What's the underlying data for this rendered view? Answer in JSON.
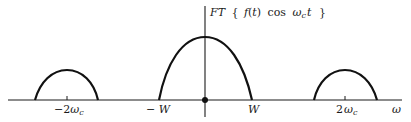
{
  "diagram": {
    "title": {
      "prefix": "FT",
      "open_brace": "{",
      "func": "f",
      "paren_open": "(",
      "var": "t",
      "paren_close": ")",
      "cos": "cos",
      "omega": "ω",
      "sub": "c",
      "t": "t",
      "close_brace": "}"
    },
    "x_axis_label": "ω",
    "ticks": [
      {
        "id": "neg-2wc",
        "coeff": "−2",
        "sym": "ω",
        "sub": "c"
      },
      {
        "id": "neg-w",
        "text": "− W"
      },
      {
        "id": "w",
        "text": "W"
      },
      {
        "id": "pos-2wc",
        "coeff": "2",
        "sym": "ω",
        "sub": "c"
      }
    ],
    "lobes": [
      {
        "name": "left-sideband",
        "center": "−2ωc",
        "relative_height": 0.48
      },
      {
        "name": "baseband",
        "center": "0",
        "half_width": "W",
        "relative_height": 1.0
      },
      {
        "name": "right-sideband",
        "center": "2ωc",
        "relative_height": 0.48
      }
    ],
    "origin_marker": "dot"
  }
}
